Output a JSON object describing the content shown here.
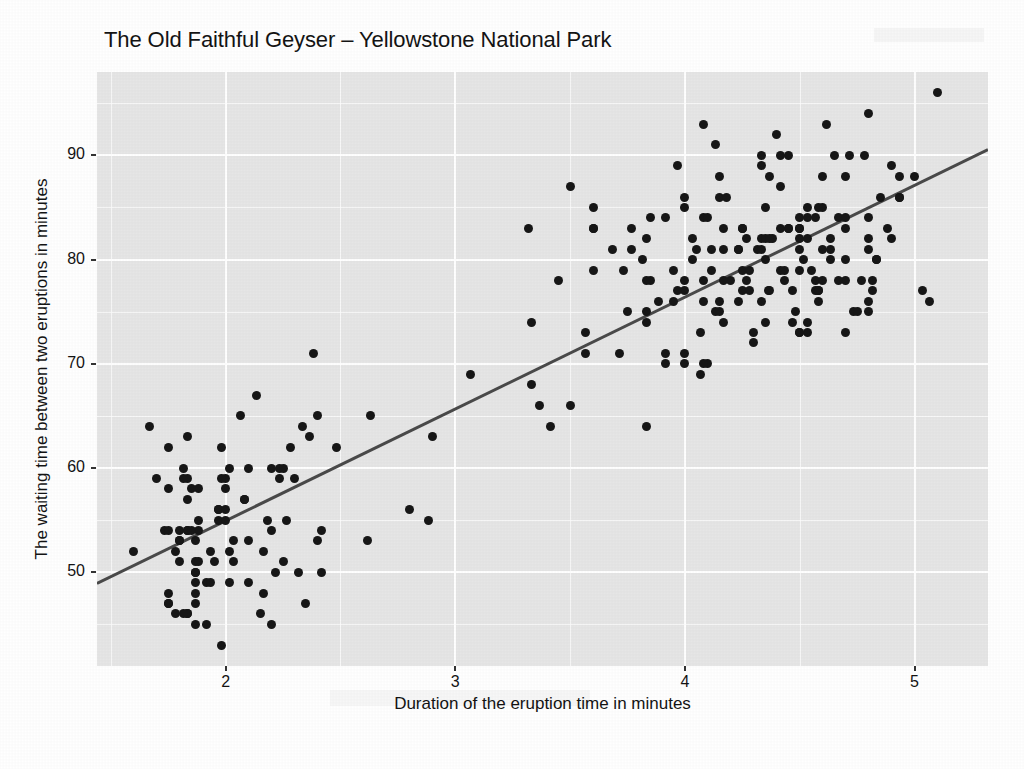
{
  "chart_data": {
    "type": "scatter",
    "title": "The Old Faithful Geyser – Yellowstone National Park",
    "xlabel": "Duration of the eruption time in minutes",
    "ylabel": "The waiting time between two eruptions in minutes",
    "xlim": [
      1.44,
      5.32
    ],
    "ylim": [
      41.0,
      98.0
    ],
    "xticks": [
      2,
      3,
      4,
      5
    ],
    "xtick_labels": [
      "2",
      "3",
      "4",
      "5"
    ],
    "yticks": [
      50,
      60,
      70,
      80,
      90
    ],
    "ytick_labels": [
      "50",
      "60",
      "70",
      "80",
      "90"
    ],
    "x_minor_ticks": [
      1.5,
      2.5,
      3.5,
      4.5
    ],
    "y_minor_ticks": [
      45,
      55,
      65,
      75,
      85,
      95
    ],
    "grid": true,
    "grid_color": "#ffffff",
    "panel_background": "#e6e6e6",
    "point_color": "#171717",
    "point_size_px": 9,
    "legend": null,
    "series_name": "Old Faithful eruptions",
    "trend_line": {
      "type": "linear-regression",
      "color": "#4a4a4a",
      "width_px": 3,
      "slope": 10.73,
      "intercept": 33.47,
      "x_start": 1.44,
      "y_start": 48.92,
      "x_end": 5.32,
      "y_end": 90.55
    },
    "n_points": 272,
    "x": [
      3.6,
      1.8,
      3.333,
      2.283,
      4.533,
      2.883,
      4.7,
      3.6,
      1.95,
      4.35,
      1.833,
      3.917,
      4.2,
      1.75,
      4.7,
      2.167,
      1.75,
      4.8,
      1.6,
      4.25,
      1.8,
      1.75,
      3.45,
      3.067,
      4.533,
      3.6,
      1.967,
      4.083,
      3.85,
      4.433,
      4.3,
      4.467,
      3.367,
      4.033,
      3.833,
      2.017,
      1.867,
      4.833,
      1.833,
      4.783,
      4.35,
      1.883,
      4.567,
      1.75,
      4.533,
      3.317,
      3.833,
      2.1,
      4.633,
      2.0,
      4.8,
      4.716,
      1.833,
      4.833,
      1.733,
      4.883,
      3.717,
      1.667,
      4.567,
      4.317,
      2.233,
      4.5,
      1.75,
      4.8,
      1.817,
      4.4,
      4.167,
      4.7,
      2.067,
      4.7,
      4.033,
      1.967,
      4.5,
      4.0,
      1.983,
      5.067,
      2.017,
      4.567,
      3.883,
      3.6,
      4.133,
      4.333,
      4.1,
      2.633,
      4.067,
      4.933,
      3.95,
      4.517,
      2.167,
      4.0,
      2.2,
      4.333,
      1.867,
      4.817,
      1.833,
      4.3,
      4.667,
      3.75,
      1.867,
      4.9,
      2.483,
      4.367,
      2.1,
      4.5,
      4.05,
      1.867,
      4.7,
      1.783,
      4.85,
      3.683,
      4.733,
      2.3,
      4.9,
      4.417,
      1.7,
      4.633,
      2.317,
      4.6,
      1.817,
      4.417,
      2.617,
      4.067,
      4.25,
      1.967,
      4.6,
      3.767,
      1.917,
      4.5,
      2.267,
      4.65,
      1.867,
      4.167,
      2.8,
      4.333,
      1.833,
      4.383,
      1.883,
      4.933,
      2.033,
      3.733,
      4.233,
      2.233,
      4.533,
      4.817,
      4.333,
      1.983,
      4.633,
      2.017,
      5.1,
      1.8,
      5.033,
      4.0,
      2.4,
      4.6,
      3.567,
      4.0,
      4.5,
      4.083,
      1.8,
      3.967,
      2.2,
      4.15,
      2.0,
      3.833,
      3.5,
      4.583,
      2.367,
      5.0,
      1.933,
      4.617,
      1.917,
      2.083,
      4.583,
      3.333,
      4.167,
      4.333,
      4.5,
      2.417,
      4.0,
      4.167,
      1.883,
      4.583,
      4.25,
      3.767,
      2.033,
      4.433,
      4.083,
      1.833,
      4.417,
      2.183,
      4.8,
      1.833,
      4.8,
      4.1,
      3.966,
      4.233,
      3.5,
      4.366,
      2.25,
      4.667,
      2.1,
      4.35,
      4.133,
      1.867,
      4.6,
      1.783,
      4.367,
      3.85,
      1.933,
      4.5,
      2.383,
      4.7,
      1.867,
      3.833,
      3.417,
      4.233,
      2.4,
      4.8,
      2.0,
      4.15,
      1.867,
      4.267,
      1.75,
      4.483,
      4.0,
      4.117,
      4.083,
      4.267,
      3.917,
      4.55,
      4.083,
      2.417,
      4.183,
      2.217,
      4.45,
      1.883,
      1.85,
      4.283,
      3.95,
      2.333,
      4.15,
      2.35,
      4.933,
      2.9,
      4.583,
      3.833,
      2.083,
      4.367,
      2.133,
      4.35,
      2.2,
      4.45,
      3.567,
      4.5,
      4.15,
      3.817,
      3.917,
      4.45,
      2.0,
      4.283,
      4.767,
      4.533,
      1.85,
      4.25,
      1.983,
      2.25,
      4.75,
      4.117,
      2.15,
      4.417,
      1.817,
      4.467
    ],
    "y": [
      79,
      54,
      74,
      62,
      85,
      55,
      88,
      85,
      51,
      85,
      54,
      84,
      78,
      47,
      83,
      52,
      62,
      84,
      52,
      79,
      51,
      47,
      78,
      69,
      74,
      83,
      55,
      76,
      78,
      79,
      73,
      77,
      66,
      80,
      74,
      52,
      48,
      80,
      59,
      90,
      80,
      58,
      84,
      58,
      73,
      83,
      64,
      53,
      82,
      59,
      75,
      90,
      54,
      80,
      54,
      83,
      71,
      64,
      77,
      81,
      59,
      84,
      48,
      82,
      60,
      92,
      78,
      78,
      65,
      73,
      82,
      56,
      79,
      71,
      62,
      76,
      60,
      78,
      76,
      83,
      75,
      82,
      70,
      65,
      73,
      88,
      76,
      80,
      48,
      86,
      60,
      90,
      50,
      78,
      63,
      72,
      84,
      75,
      51,
      82,
      62,
      88,
      49,
      83,
      81,
      47,
      84,
      52,
      86,
      81,
      75,
      59,
      89,
      79,
      59,
      81,
      50,
      85,
      59,
      87,
      53,
      69,
      77,
      56,
      88,
      81,
      45,
      82,
      55,
      90,
      45,
      83,
      56,
      89,
      46,
      82,
      51,
      86,
      53,
      79,
      81,
      60,
      82,
      77,
      76,
      59,
      80,
      49,
      96,
      53,
      77,
      77,
      65,
      81,
      71,
      70,
      81,
      93,
      53,
      89,
      45,
      86,
      58,
      78,
      66,
      76,
      63,
      88,
      52,
      93,
      49,
      57,
      77,
      68,
      81,
      81,
      73,
      50,
      85,
      74,
      55,
      77,
      83,
      83,
      51,
      78,
      84,
      46,
      83,
      55,
      81,
      57,
      76,
      84,
      77,
      81,
      87,
      77,
      51,
      78,
      60,
      82,
      91,
      53,
      78,
      46,
      77,
      84,
      49,
      83,
      71,
      80,
      49,
      75,
      64,
      76,
      53,
      94,
      55,
      76,
      50,
      82,
      54,
      75,
      78,
      79,
      78,
      78,
      70,
      79,
      70,
      54,
      86,
      50,
      90,
      54,
      54,
      77,
      79,
      64,
      75,
      47,
      86,
      63,
      85,
      82,
      57,
      82,
      67,
      74,
      54,
      83,
      73,
      73,
      88,
      80,
      71,
      83,
      56,
      79,
      78,
      84,
      58,
      83,
      43,
      60,
      75,
      81,
      46,
      90,
      46,
      74
    ]
  },
  "figure": {
    "title": "The Old Faithful Geyser – Yellowstone National Park",
    "x_axis_title": "Duration of the eruption time in minutes",
    "y_axis_title": "The waiting time between two eruptions in minutes"
  }
}
